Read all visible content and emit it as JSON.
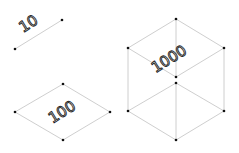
{
  "diagram": {
    "title": "",
    "figures": [
      {
        "id": "line",
        "label": "10",
        "shape": "line",
        "points": [
          [
            15,
            49
          ],
          [
            62,
            20
          ]
        ]
      },
      {
        "id": "rhombus",
        "label": "100",
        "shape": "square-isometric",
        "points": [
          [
            63,
            84
          ],
          [
            110,
            112
          ],
          [
            63,
            140
          ],
          [
            15,
            112
          ]
        ]
      },
      {
        "id": "cube",
        "label": "1000",
        "shape": "cube-isometric",
        "points": [
          [
            176,
            19
          ],
          [
            224,
            48
          ],
          [
            224,
            111
          ],
          [
            176,
            140
          ],
          [
            128,
            111
          ],
          [
            128,
            48
          ],
          [
            176,
            77
          ],
          [
            176,
            83
          ]
        ]
      }
    ],
    "colors": {
      "edge": "#c8c8c8",
      "point": "#111111",
      "label_stroke": "#222222",
      "background": "#ffffff"
    }
  }
}
